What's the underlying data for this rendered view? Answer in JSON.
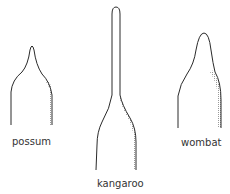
{
  "figure": {
    "type": "comparative outline drawings of animal shapes",
    "line_color": "#2a2a2a",
    "shade_color": "#9a9a9a",
    "items": [
      {
        "id": "possum",
        "label": "possum"
      },
      {
        "id": "kangaroo",
        "label": "kangaroo"
      },
      {
        "id": "wombat",
        "label": "wombat"
      }
    ]
  }
}
